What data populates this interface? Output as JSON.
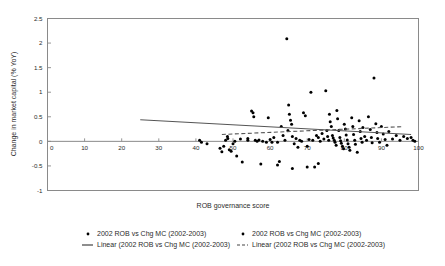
{
  "chart_data": {
    "type": "scatter",
    "title": "",
    "xlabel": "ROB governance score",
    "ylabel": "Change in market capital (% YoY)",
    "xlim": [
      0,
      100
    ],
    "ylim": [
      -1,
      2.5
    ],
    "xticks": [
      0,
      10,
      20,
      30,
      40,
      50,
      60,
      70,
      80,
      90,
      100
    ],
    "xticklabels": [
      "0",
      "10",
      "20",
      "30",
      "40",
      "50",
      "60",
      "70",
      "80",
      "90",
      "100"
    ],
    "yticks": [
      -1,
      -0.5,
      0,
      0.5,
      1,
      1.5,
      2,
      2.5
    ],
    "yticklabels": [
      "-1",
      "-0.5",
      "0",
      "0.5",
      "1",
      "1.5",
      "2",
      "2.5"
    ],
    "grid": false,
    "legend_position": "bottom",
    "marker_color": "#000000",
    "trendline_color": "#555555",
    "series": [
      {
        "name": "2002 ROB vs Chg MC (2002-2003)",
        "type": "scatter",
        "points": [
          [
            41.0,
            0.02
          ],
          [
            41.5,
            -0.02
          ],
          [
            43.0,
            -0.05
          ],
          [
            46.5,
            -0.14
          ],
          [
            47.0,
            -0.21
          ],
          [
            47.5,
            -0.1
          ],
          [
            48.0,
            0.02
          ],
          [
            48.5,
            0.1
          ],
          [
            48.6,
            0.06
          ],
          [
            49.0,
            -0.17
          ],
          [
            49.5,
            -0.2
          ],
          [
            50.0,
            -0.05
          ],
          [
            50.5,
            0.0
          ],
          [
            51.0,
            -0.3
          ],
          [
            52.0,
            0.05
          ],
          [
            54.0,
            0.06
          ],
          [
            55.0,
            0.62
          ],
          [
            55.4,
            0.58
          ],
          [
            55.6,
            0.5
          ],
          [
            56.0,
            0.02
          ],
          [
            57.0,
            0.03
          ],
          [
            58.0,
            0.0
          ],
          [
            59.0,
            -0.02
          ],
          [
            59.5,
            0.48
          ],
          [
            60.0,
            0.04
          ],
          [
            61.0,
            0.08
          ],
          [
            62.0,
            -0.02
          ],
          [
            62.5,
            -0.41
          ],
          [
            63.0,
            0.3
          ],
          [
            63.5,
            0.12
          ],
          [
            64.0,
            0.02
          ],
          [
            64.5,
            2.09
          ],
          [
            64.8,
            0.22
          ],
          [
            65.0,
            0.74
          ],
          [
            65.2,
            0.55
          ],
          [
            65.5,
            0.43
          ],
          [
            65.8,
            0.35
          ],
          [
            66.0,
            0.1
          ],
          [
            66.5,
            -0.05
          ],
          [
            67.0,
            0.06
          ],
          [
            67.5,
            -0.12
          ],
          [
            68.0,
            0.02
          ],
          [
            68.5,
            0.0
          ],
          [
            69.0,
            0.58
          ],
          [
            69.5,
            0.52
          ],
          [
            70.0,
            -0.1
          ],
          [
            70.5,
            0.04
          ],
          [
            71.0,
            1.0
          ],
          [
            71.5,
            0.02
          ],
          [
            72.0,
            -0.52
          ],
          [
            72.5,
            0.12
          ],
          [
            73.0,
            0.08
          ],
          [
            73.5,
            0.0
          ],
          [
            74.0,
            0.16
          ],
          [
            74.5,
            0.05
          ],
          [
            75.0,
            1.03
          ],
          [
            75.3,
            0.22
          ],
          [
            75.5,
            0.1
          ],
          [
            75.8,
            0.02
          ],
          [
            76.0,
            0.55
          ],
          [
            76.2,
            0.4
          ],
          [
            76.5,
            0.3
          ],
          [
            76.8,
            0.12
          ],
          [
            77.0,
            0.07
          ],
          [
            77.3,
            0.02
          ],
          [
            77.5,
            -0.02
          ],
          [
            77.8,
            -0.08
          ],
          [
            78.0,
            0.63
          ],
          [
            78.2,
            0.46
          ],
          [
            78.5,
            0.22
          ],
          [
            78.8,
            0.08
          ],
          [
            79.0,
            0.01
          ],
          [
            79.2,
            -0.04
          ],
          [
            79.5,
            -0.1
          ],
          [
            79.8,
            -0.15
          ],
          [
            80.0,
            0.35
          ],
          [
            80.3,
            0.25
          ],
          [
            80.5,
            0.13
          ],
          [
            80.8,
            0.03
          ],
          [
            81.0,
            -0.05
          ],
          [
            81.3,
            -0.12
          ],
          [
            81.5,
            -0.18
          ],
          [
            82.0,
            0.48
          ],
          [
            82.3,
            0.3
          ],
          [
            82.5,
            0.14
          ],
          [
            82.8,
            0.02
          ],
          [
            83.0,
            -0.06
          ],
          [
            83.5,
            -0.22
          ],
          [
            84.0,
            0.42
          ],
          [
            84.3,
            0.2
          ],
          [
            84.5,
            0.06
          ],
          [
            84.8,
            -0.02
          ],
          [
            85.0,
            0.28
          ],
          [
            85.5,
            0.1
          ],
          [
            86.0,
            0.02
          ],
          [
            86.5,
            0.5
          ],
          [
            87.0,
            0.24
          ],
          [
            87.3,
            0.08
          ],
          [
            87.5,
            -0.03
          ],
          [
            88.0,
            1.29
          ],
          [
            88.5,
            0.36
          ],
          [
            88.8,
            0.18
          ],
          [
            89.0,
            0.06
          ],
          [
            89.5,
            -0.02
          ],
          [
            90.0,
            0.3
          ],
          [
            90.5,
            0.15
          ],
          [
            91.0,
            0.04
          ],
          [
            91.5,
            -0.08
          ],
          [
            92.0,
            0.2
          ],
          [
            93.0,
            0.05
          ],
          [
            94.0,
            0.12
          ],
          [
            95.0,
            0.02
          ],
          [
            96.0,
            0.1
          ],
          [
            97.0,
            0.06
          ],
          [
            98.0,
            0.08
          ],
          [
            98.5,
            0.02
          ],
          [
            99.0,
            0.0
          ],
          [
            52.5,
            -0.42
          ],
          [
            57.5,
            -0.46
          ],
          [
            62.0,
            -0.48
          ],
          [
            66.0,
            -0.55
          ],
          [
            70.0,
            -0.52
          ],
          [
            73.0,
            -0.45
          ],
          [
            54.0,
            0.02
          ],
          [
            56.5,
            0.0
          ],
          [
            60.5,
            -0.02
          ]
        ]
      },
      {
        "name": "Linear (2002 ROB vs Chg MC (2002-2003)",
        "type": "line",
        "style": "solid",
        "endpoints": [
          [
            25.0,
            0.44
          ],
          [
            98.0,
            0.14
          ]
        ]
      },
      {
        "name": "Linear (2002 ROB vs Chg MC (2002-2003)",
        "type": "line",
        "style": "dashed",
        "endpoints": [
          [
            47.0,
            0.14
          ],
          [
            96.0,
            0.3
          ]
        ]
      }
    ]
  },
  "legend": {
    "entries": [
      {
        "marker": "dot",
        "label": "2002 ROB vs Chg MC (2002-2003)"
      },
      {
        "marker": "dot",
        "label": "2002 ROB vs Chg MC (2002-2003)"
      },
      {
        "marker": "solid-line",
        "label": "Linear (2002 ROB vs Chg MC (2002-2003)"
      },
      {
        "marker": "dashed-line",
        "label": "Linear (2002 ROB vs Chg MC (2002-2003)"
      }
    ]
  }
}
